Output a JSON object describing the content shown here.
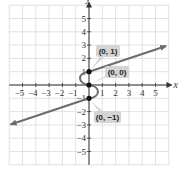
{
  "chart_data": {
    "type": "line",
    "title": "",
    "xlabel": "x",
    "ylabel": "y",
    "xlim": [
      -6,
      6
    ],
    "ylim": [
      -6,
      6
    ],
    "grid": true,
    "x_ticks": [
      -5,
      -4,
      -3,
      -2,
      -1,
      1,
      2,
      3,
      4,
      5
    ],
    "y_ticks": [
      -5,
      -4,
      -3,
      -2,
      -1,
      1,
      2,
      3,
      4,
      5
    ],
    "x_tick_labels": [
      "−5",
      "−4",
      "−3",
      "−2",
      "−1",
      "1",
      "2",
      "3",
      "4",
      "5"
    ],
    "y_tick_labels": [
      "−5",
      "−4",
      "−3",
      "−2",
      "−1",
      "1",
      "2",
      "3",
      "4",
      "5"
    ],
    "series": [
      {
        "name": "upper ray",
        "x": [
          0,
          5.8
        ],
        "y": [
          1,
          2.93
        ],
        "arrow_end": true
      },
      {
        "name": "S-curve",
        "x": [
          0,
          -0.6,
          0,
          0.6,
          0
        ],
        "y": [
          1,
          0.5,
          0,
          -0.5,
          -1
        ]
      },
      {
        "name": "lower ray",
        "x": [
          0,
          -5.9
        ],
        "y": [
          -1,
          -2.97
        ],
        "arrow_end": true
      }
    ],
    "points": [
      {
        "x": 0,
        "y": 1,
        "label": "(0, 1)"
      },
      {
        "x": 0,
        "y": 0,
        "label": "(0, 0)"
      },
      {
        "x": 0,
        "y": -1,
        "label": "(0, −1)"
      }
    ],
    "colors": {
      "curve": "#6b6b6b",
      "grid": "#d9d9d9",
      "axis": "#333333",
      "callout": "#d4d4d4",
      "point": "#111111"
    }
  }
}
